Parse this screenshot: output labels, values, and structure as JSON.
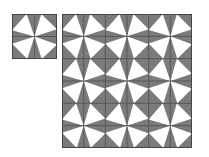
{
  "figure": {
    "background": "#ffffff",
    "colors": {
      "cell_fill": "#7b7b7b",
      "triangle_fill": "#ffffff",
      "grid_line": "#4f4f4f",
      "border": "#454545"
    },
    "motif": {
      "name": "pinwheel-block",
      "description": "2x2 block of cells, each with a white triangle whose apex meets the block center",
      "cells": [
        {
          "row": 0,
          "col": 0,
          "apex": "bottom-right",
          "points": [
            [
              1,
              1
            ],
            [
              0.65,
              0
            ],
            [
              0,
              0.72
            ]
          ]
        },
        {
          "row": 0,
          "col": 1,
          "apex": "bottom-left",
          "points": [
            [
              0,
              1
            ],
            [
              0.3,
              0
            ],
            [
              1,
              0.68
            ]
          ]
        },
        {
          "row": 1,
          "col": 0,
          "apex": "top-right",
          "points": [
            [
              1,
              0
            ],
            [
              0,
              0.32
            ],
            [
              0.68,
              1
            ]
          ]
        },
        {
          "row": 1,
          "col": 1,
          "apex": "top-left",
          "points": [
            [
              0,
              0
            ],
            [
              0.32,
              1
            ],
            [
              1,
              0.35
            ]
          ]
        }
      ]
    },
    "small_tile": {
      "x": 12,
      "y": 14,
      "width": 45,
      "height": 45,
      "block_rows": 1,
      "block_cols": 1
    },
    "large_tiling": {
      "x": 62,
      "y": 14,
      "width": 130,
      "height": 134,
      "block_rows": 3,
      "block_cols": 3
    }
  }
}
